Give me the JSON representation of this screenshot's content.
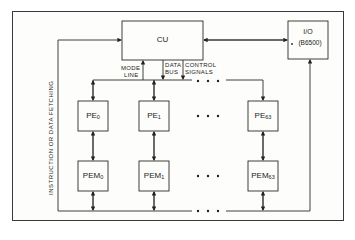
{
  "diagram": {
    "type": "block-diagram",
    "title": "",
    "nodes": {
      "cu": {
        "label": "CU"
      },
      "io": {
        "label_line1": "I/O",
        "label_line2": "(B6500)"
      },
      "pe": [
        {
          "base": "PE",
          "sub": "0"
        },
        {
          "base": "PE",
          "sub": "1"
        },
        {
          "base": "PE",
          "sub": "63"
        }
      ],
      "pem": [
        {
          "base": "PEM",
          "sub": "0"
        },
        {
          "base": "PEM",
          "sub": "1"
        },
        {
          "base": "PEM",
          "sub": "63"
        }
      ]
    },
    "bus_labels": {
      "mode_line_1": "MODE",
      "mode_line_2": "LINE",
      "data_bus_1": "DATA",
      "data_bus_2": "BUS",
      "control_1": "CONTROL",
      "control_2": "SIGNALS"
    },
    "side_label": "INSTRUCTION OR DATA FETCHING",
    "ellipsis": "• • •",
    "edges": [
      {
        "from": "cu",
        "to": "io",
        "type": "bidirectional"
      },
      {
        "from": "cu",
        "to": "pe_bus",
        "label": "MODE LINE"
      },
      {
        "from": "cu",
        "to": "pe_bus",
        "label": "DATA BUS"
      },
      {
        "from": "cu",
        "to": "pe_bus",
        "label": "CONTROL SIGNALS"
      },
      {
        "from": "pe_bus",
        "to": "PE0"
      },
      {
        "from": "pe_bus",
        "to": "PE1"
      },
      {
        "from": "pe_bus",
        "to": "PE63"
      },
      {
        "from": "PE0",
        "to": "PEM0",
        "type": "bidirectional"
      },
      {
        "from": "PE1",
        "to": "PEM1",
        "type": "bidirectional"
      },
      {
        "from": "PE63",
        "to": "PEM63",
        "type": "bidirectional"
      },
      {
        "from": "memory_bus",
        "to": "cu",
        "label": "INSTRUCTION OR DATA FETCHING"
      },
      {
        "from": "memory_bus",
        "to": "io",
        "type": "bidirectional"
      }
    ]
  }
}
